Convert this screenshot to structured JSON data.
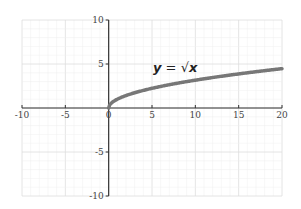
{
  "chart_data": {
    "type": "line",
    "title": "",
    "xlabel": "",
    "ylabel": "",
    "xlim": [
      -10,
      20
    ],
    "ylim": [
      -10,
      10
    ],
    "grid": true,
    "grid_minor_step": 1,
    "x_ticks": [
      -10,
      -5,
      0,
      5,
      10,
      15,
      20
    ],
    "x_tick_labels": [
      "-10",
      "-5",
      "0",
      "5",
      "10",
      "15",
      "20"
    ],
    "y_ticks": [
      10,
      5,
      -5,
      -10
    ],
    "y_tick_labels": [
      "10",
      "5",
      "-5",
      "-10"
    ],
    "annotations": [
      {
        "text": "y = √x",
        "x": 8.6,
        "y": 4.6
      }
    ],
    "series": [
      {
        "name": "y = √x",
        "function": "sqrt",
        "x": [
          0,
          0.25,
          0.5,
          1,
          2,
          3,
          4,
          5,
          6,
          8,
          10,
          12,
          14,
          16,
          18,
          20
        ],
        "y": [
          0,
          0.5,
          0.71,
          1,
          1.41,
          1.73,
          2,
          2.24,
          2.45,
          2.83,
          3.16,
          3.46,
          3.74,
          4,
          4.24,
          4.47
        ],
        "color": "#777777"
      }
    ]
  },
  "labels": {
    "equation_y": "y",
    "equation_eq": " = ",
    "equation_sqrt": "√",
    "equation_x": "x"
  },
  "colors": {
    "axis": "#333333",
    "grid_minor": "#eeeeee",
    "grid_major": "#dddddd",
    "curve": "#777777"
  }
}
